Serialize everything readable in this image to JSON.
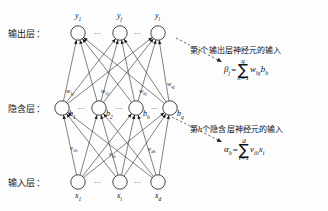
{
  "diagram": {
    "colors": {
      "background": "#fdfdfd",
      "stroke": "#1a1a1a",
      "text": "#111111",
      "dashed": "#333333"
    },
    "layers": [
      {
        "key": "output",
        "label": "输出层：",
        "nodes": [
          {
            "id": "y1",
            "label": "y",
            "sub": "1",
            "cx": 78,
            "cy": 33
          },
          {
            "id": "yj",
            "label": "y",
            "sub": "j",
            "cx": 120,
            "cy": 33
          },
          {
            "id": "yl",
            "label": "y",
            "sub": "l",
            "cx": 158,
            "cy": 33
          }
        ],
        "label_position": "above",
        "ellipsis": [
          "…",
          "…"
        ]
      },
      {
        "key": "hidden",
        "label": "隐含层：",
        "nodes": [
          {
            "id": "b1",
            "label": "b",
            "sub": "1",
            "cx": 62,
            "cy": 108
          },
          {
            "id": "b2",
            "label": "b",
            "sub": "2",
            "cx": 99,
            "cy": 108
          },
          {
            "id": "bh",
            "label": "b",
            "sub": "h",
            "cx": 136,
            "cy": 108
          },
          {
            "id": "bq",
            "label": "b",
            "sub": "q",
            "cx": 170,
            "cy": 108
          }
        ],
        "label_position": "right",
        "ellipsis": [
          "…",
          "…",
          "…"
        ]
      },
      {
        "key": "input",
        "label": "输入层：",
        "nodes": [
          {
            "id": "x1",
            "label": "x",
            "sub": "1",
            "cx": 78,
            "cy": 182
          },
          {
            "id": "xi",
            "label": "x",
            "sub": "i",
            "cx": 120,
            "cy": 182
          },
          {
            "id": "xd",
            "label": "x",
            "sub": "d",
            "cx": 158,
            "cy": 182
          }
        ],
        "label_position": "below",
        "ellipsis": [
          "…",
          "…"
        ]
      }
    ],
    "weights_hidden_to_output": [
      {
        "id": "w1j",
        "base": "w",
        "sub": "1j",
        "x": 66,
        "y": 87
      },
      {
        "id": "w2j",
        "base": "w",
        "sub": "2j",
        "x": 101,
        "y": 87
      },
      {
        "id": "whj",
        "base": "w",
        "sub": "hj",
        "x": 139,
        "y": 87
      },
      {
        "id": "wqj",
        "base": "w",
        "sub": "qj",
        "x": 167,
        "y": 80
      }
    ],
    "weights_input_to_hidden": [
      {
        "id": "v1h",
        "base": "v",
        "sub": "1h",
        "x": 70,
        "y": 144
      },
      {
        "id": "vih",
        "base": "v",
        "sub": "ih",
        "x": 109,
        "y": 150
      },
      {
        "id": "vdh",
        "base": "v",
        "sub": "dh",
        "x": 148,
        "y": 145
      }
    ],
    "annotations": [
      {
        "id": "beta-annotation",
        "text_before": "第",
        "text_italic": "j",
        "text_after": "个输出层神经元的输入",
        "full_text": "第j个输出层神经元的输入",
        "x": 190,
        "y": 49,
        "arrow": {
          "x1": 176,
          "y1": 38,
          "x2": 222,
          "y2": 62
        }
      },
      {
        "id": "alpha-annotation",
        "text_before": "第",
        "text_italic": "h",
        "text_after": "个隐含层神经元的输入",
        "full_text": "第h个隐含层神经元的输入",
        "x": 190,
        "y": 128,
        "arrow": {
          "x1": 172,
          "y1": 117,
          "x2": 222,
          "y2": 142
        }
      }
    ],
    "formulas": [
      {
        "id": "beta-formula",
        "lhs": "β",
        "lhs_sub": "j",
        "eq": "=",
        "sigma": "∑",
        "upper": "q",
        "lower": "h=1",
        "terms": "w",
        "terms_sub1": "hj",
        "terms2": "b",
        "terms_sub2": "h",
        "plain": "β_j = Σ_{h=1}^{q} w_hj b_h",
        "x": 224,
        "y": 66
      },
      {
        "id": "alpha-formula",
        "lhs": "α",
        "lhs_sub": "h",
        "eq": "=",
        "sigma": "∑",
        "upper": "d",
        "lower": "i=1",
        "terms": "v",
        "terms_sub1": "ih",
        "terms2": "x",
        "terms_sub2": "i",
        "plain": "α_h = Σ_{i=1}^{d} v_ih x_i",
        "x": 224,
        "y": 146
      }
    ],
    "layer_label_positions": {
      "output": {
        "x": 8,
        "y": 28
      },
      "hidden": {
        "x": 8,
        "y": 103
      },
      "input": {
        "x": 8,
        "y": 177
      }
    }
  }
}
